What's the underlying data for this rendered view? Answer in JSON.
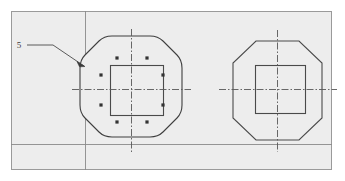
{
  "drawing": {
    "title": "Octagonal pile cap reinforcement detail",
    "background_color": "#eeeeee",
    "page_color": "#ffffff",
    "line_color": "#4a4a4a",
    "centerline_color": "#555555",
    "frame_color": "#888888",
    "canvas": {
      "width": 345,
      "height": 181
    },
    "sheet_frame": {
      "name": "sheet-border",
      "x": 11,
      "y": 11,
      "width": 321,
      "height": 159,
      "stroke": "#9a9a9a"
    },
    "grid_lines": [
      {
        "name": "vertical-grid-line",
        "orientation": "vertical",
        "x1": 85,
        "y1": 11,
        "x2": 85,
        "y2": 170,
        "stroke": "#8a8a8a"
      },
      {
        "name": "horizontal-grid-line",
        "orientation": "horizontal",
        "x1": 11,
        "y1": 144,
        "x2": 332,
        "y2": 144,
        "stroke": "#8a8a8a"
      }
    ],
    "annotations": [
      {
        "name": "callout-5",
        "label": "5",
        "label_x": 19,
        "label_y": 48,
        "leader": "M 27 45 L 53 45 L 85 66",
        "arrow_at": {
          "x": 85,
          "y": 66
        },
        "points_to": "left-octagon-edge"
      }
    ],
    "views": [
      {
        "name": "left-octagon-view",
        "id": "left",
        "style": "rounded-corners",
        "has_rebar_dots": true,
        "center": {
          "x": 131,
          "y": 89
        },
        "octagon_points": "110,36 152,36 182,60 182,113 152,142 110,142 80,113 80,60",
        "corner_radius": 13,
        "inner_square": {
          "x": 110,
          "y": 65,
          "width": 53,
          "height": 50
        },
        "centerlines": {
          "vertical": {
            "x1": 131,
            "y1": 29,
            "x2": 131,
            "y2": 152
          },
          "horizontal": {
            "x1": 73,
            "y1": 89,
            "x2": 190,
            "y2": 89
          }
        },
        "rebar_dots": [
          {
            "name": "rebar-dot-top-left",
            "x": 117,
            "y": 58
          },
          {
            "name": "rebar-dot-top-right",
            "x": 147,
            "y": 58
          },
          {
            "name": "rebar-dot-mid-left",
            "x": 101,
            "y": 75
          },
          {
            "name": "rebar-dot-mid-right",
            "x": 163,
            "y": 75
          },
          {
            "name": "rebar-dot-low-left",
            "x": 101,
            "y": 105
          },
          {
            "name": "rebar-dot-low-right",
            "x": 163,
            "y": 105
          },
          {
            "name": "rebar-dot-bottom-left",
            "x": 117,
            "y": 122
          },
          {
            "name": "rebar-dot-bottom-right",
            "x": 147,
            "y": 122
          }
        ],
        "rebar_dot_count": 8,
        "rebar_dot_radius": 1.6
      },
      {
        "name": "right-octagon-view",
        "id": "right",
        "style": "sharp-corners",
        "has_rebar_dots": false,
        "center": {
          "x": 277,
          "y": 89
        },
        "octagon_points": "256,41 299,41 322,62 322,117 299,140 256,140 232,117 232,62",
        "corner_radius": 0,
        "inner_square": {
          "x": 255,
          "y": 65,
          "width": 50,
          "height": 48
        },
        "centerlines": {
          "vertical": {
            "x1": 277,
            "y1": 30,
            "x2": 277,
            "y2": 152
          },
          "horizontal": {
            "x1": 219,
            "y1": 89,
            "x2": 335,
            "y2": 89
          }
        },
        "rebar_dots": [],
        "rebar_dot_count": 0,
        "rebar_dot_radius": 1.6
      }
    ]
  }
}
